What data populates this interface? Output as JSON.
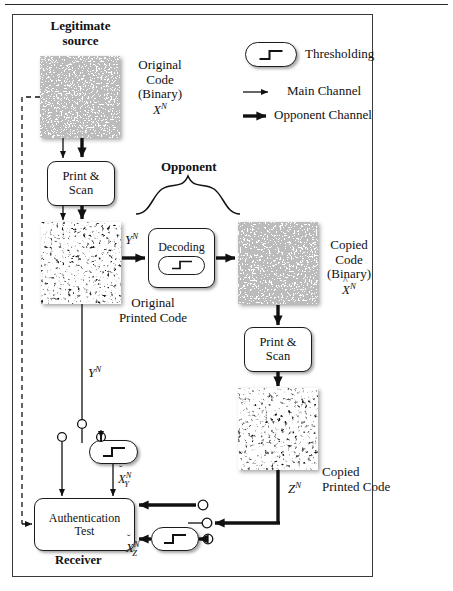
{
  "figure": {
    "title_hidden": "Authentication model with legitimate source, opponent and receiver",
    "frame_border_color": "#3a3a3a"
  },
  "legend": {
    "thresholding_label": "Thresholding",
    "main_channel_label": "Main Channel",
    "opponent_channel_label": "Opponent Channel",
    "threshold_icon": "step-function-icon",
    "main_channel_icon": "thin-arrow-icon",
    "opponent_channel_icon": "thick-arrow-icon"
  },
  "actors": {
    "legitimate_source_line1": "Legitimate",
    "legitimate_source_line2": "source",
    "opponent": "Opponent",
    "receiver": "Receiver"
  },
  "blocks": {
    "print_scan_left_line1": "Print &",
    "print_scan_left_line2": "Scan",
    "print_scan_right_line1": "Print &",
    "print_scan_right_line2": "Scan",
    "decoding": "Decoding",
    "auth_test_line1": "Authentication",
    "auth_test_line2": "Test"
  },
  "patches": {
    "original_code_caption_line1": "Original",
    "original_code_caption_line2": "Code",
    "original_code_caption_line3": "(Binary)",
    "original_code_symbol": "X",
    "original_code_symbol_sup": "N",
    "original_printed_caption_line1": "Original",
    "original_printed_caption_line2": "Printed Code",
    "copied_code_caption_line1": "Copied",
    "copied_code_caption_line2": "Code",
    "copied_code_caption_line3": "(Binary)",
    "copied_code_symbol": "X",
    "copied_code_symbol_sup": "N",
    "copied_code_symbol_accent": "hat",
    "copied_printed_caption_line1": "Copied",
    "copied_printed_caption_line2": "Printed Code"
  },
  "signals": {
    "y_main": "Y",
    "y_main_sup": "N",
    "y_branch": "Y",
    "y_branch_sup": "N",
    "z": "Z",
    "z_sup": "N",
    "x_check_y_base": "X",
    "x_check_y_sup": "N",
    "x_check_y_sub": "Y",
    "x_check_z_base": "X",
    "x_check_z_sup": "N",
    "x_check_z_sub": "Z"
  },
  "colors": {
    "ink": "#1b1b1b",
    "frame": "#3a3a3a",
    "paper": "#ffffff"
  }
}
